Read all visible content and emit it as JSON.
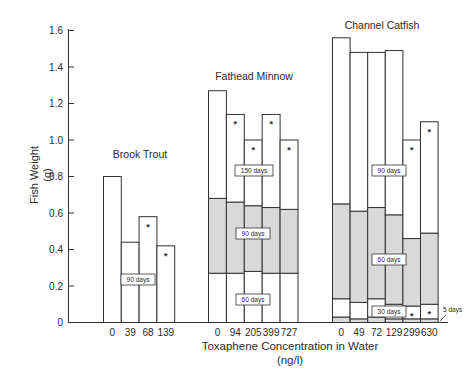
{
  "chart_data": {
    "type": "bar",
    "title": "",
    "xlabel": "Toxaphene Concentration in Water",
    "xlabel_units": "(ng/l)",
    "ylabel": "Fish Weight",
    "ylabel_units": "(g)",
    "ylim": [
      0,
      1.6
    ],
    "yticks": [
      "0",
      "0.2",
      "0.4",
      "0.6",
      "0.8",
      "1.0",
      "1.2",
      "1.4",
      "1.6"
    ],
    "grid": false,
    "significance_marker": "*",
    "groups": [
      {
        "name": "Brook Trout",
        "categories": [
          "0",
          "39",
          "68",
          "139"
        ],
        "series": [
          {
            "name": "90 days",
            "values": [
              0.8,
              0.44,
              0.58,
              0.42
            ],
            "significant": [
              false,
              false,
              true,
              true
            ]
          }
        ]
      },
      {
        "name": "Fathead Minnow",
        "categories": [
          "0",
          "94",
          "205",
          "399",
          "727"
        ],
        "series": [
          {
            "name": "60 days",
            "values": [
              0.27,
              0.27,
              0.28,
              0.27,
              0.27
            ],
            "significant": [
              false,
              false,
              false,
              false,
              false
            ]
          },
          {
            "name": "90 days",
            "values": [
              0.68,
              0.66,
              0.64,
              0.63,
              0.62
            ],
            "significant": [
              false,
              false,
              false,
              false,
              false
            ]
          },
          {
            "name": "150 days",
            "values": [
              1.27,
              1.14,
              1.0,
              1.14,
              1.0
            ],
            "significant": [
              false,
              true,
              true,
              true,
              true
            ]
          }
        ]
      },
      {
        "name": "Channel Catfish",
        "categories": [
          "0",
          "49",
          "72",
          "129",
          "299",
          "630"
        ],
        "series": [
          {
            "name": "5 days",
            "values": [
              0.03,
              0.02,
              0.03,
              0.02,
              0.02,
              0.02
            ],
            "significant": [
              false,
              false,
              false,
              false,
              false,
              false
            ]
          },
          {
            "name": "30 days",
            "values": [
              0.13,
              0.11,
              0.13,
              0.1,
              0.09,
              0.1
            ],
            "significant": [
              false,
              false,
              false,
              false,
              true,
              true
            ]
          },
          {
            "name": "60 days",
            "values": [
              0.65,
              0.61,
              0.63,
              0.59,
              0.46,
              0.49
            ],
            "significant": [
              false,
              false,
              false,
              false,
              false,
              false
            ]
          },
          {
            "name": "90 days",
            "values": [
              1.56,
              1.48,
              1.48,
              1.49,
              1.0,
              1.1
            ],
            "significant": [
              false,
              false,
              false,
              false,
              true,
              true
            ]
          }
        ]
      }
    ]
  }
}
